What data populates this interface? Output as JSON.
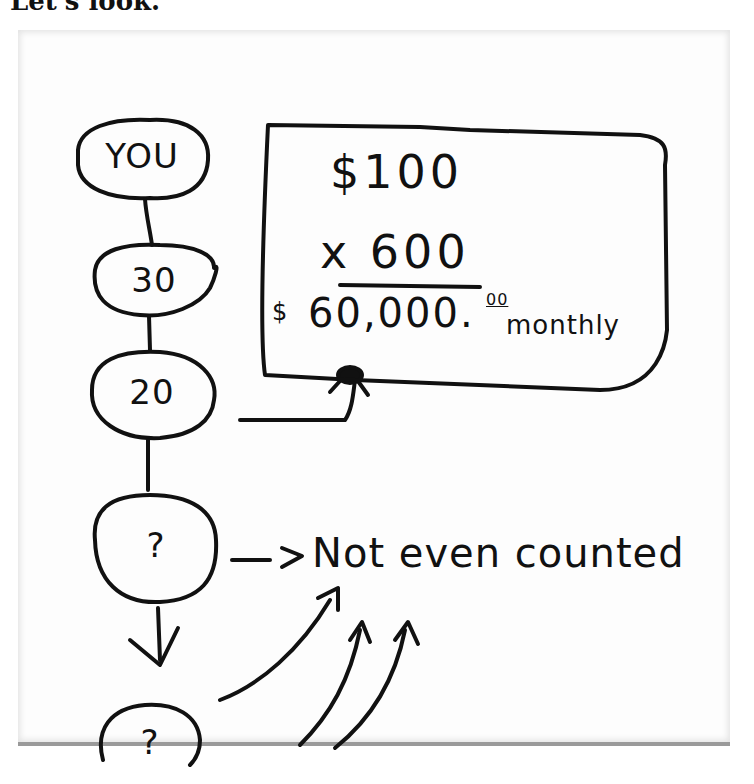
{
  "caption": "Let's look.",
  "diagram": {
    "nodes": [
      {
        "id": "you",
        "label": "YOU"
      },
      {
        "id": "n30",
        "label": "30"
      },
      {
        "id": "n20",
        "label": "20"
      },
      {
        "id": "q1",
        "label": "?"
      },
      {
        "id": "q2",
        "label": "?"
      }
    ],
    "edges": [
      {
        "from": "you",
        "to": "n30",
        "type": "line"
      },
      {
        "from": "n30",
        "to": "n20",
        "type": "line"
      },
      {
        "from": "n20",
        "to": "q1",
        "type": "line"
      },
      {
        "from": "q1",
        "to": "q2",
        "type": "arrow-down"
      },
      {
        "from": "n20",
        "to": "calc_box",
        "type": "arrow"
      },
      {
        "from": "q1",
        "to": "note",
        "type": "arrow"
      },
      {
        "from": "q2",
        "to": "note",
        "type": "curved-arrow"
      }
    ],
    "calc_box": {
      "line1": "$100",
      "line2": "x 600",
      "currency": "$",
      "result": "60,000.",
      "cents": "00",
      "period": "monthly"
    },
    "note": "Not even counted"
  }
}
